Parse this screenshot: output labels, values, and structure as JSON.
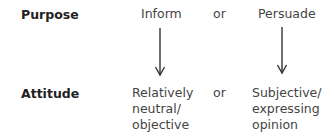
{
  "rows": {
    "purpose": {
      "label": "Purpose",
      "option_a": "Inform",
      "connector": "or",
      "option_b": "Persuade"
    },
    "attitude": {
      "label": "Attitude",
      "option_a": [
        "Relatively",
        "neutral/",
        "objective"
      ],
      "connector": "or",
      "option_b": [
        "Subjective/",
        "expressing",
        "opinion"
      ]
    }
  },
  "arrows": [
    {
      "from": "Inform",
      "to": "Relatively neutral/ objective"
    },
    {
      "from": "Persuade",
      "to": "Subjective/ expressing opinion"
    }
  ],
  "colors": {
    "text": "#444444",
    "label": "#222222",
    "arrow": "#333333"
  }
}
